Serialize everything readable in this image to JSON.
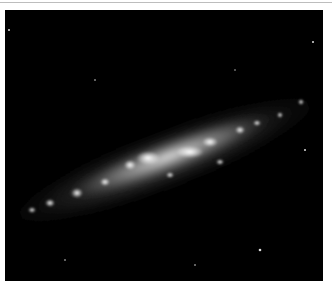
{
  "image": {
    "subject": "edge-on spiral galaxy",
    "alt": "Grayscale astronomical image of an elongated, tilted galaxy with bright knots of star formation on a black sky",
    "colors": {
      "background": "#000000",
      "border": "#ffffff",
      "top_rule": "#bdbdbd"
    }
  }
}
